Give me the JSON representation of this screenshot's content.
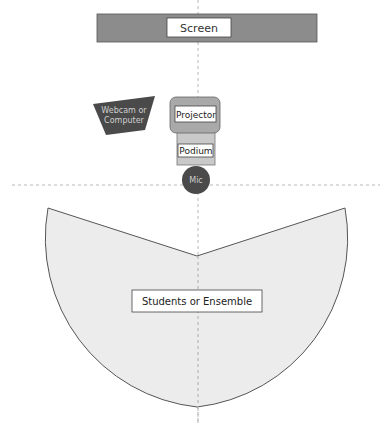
{
  "diagram": {
    "screen": {
      "label": "Screen"
    },
    "webcam": {
      "label_line1": "Webcam or",
      "label_line2": "Computer"
    },
    "projector": {
      "label": "Projector"
    },
    "podium": {
      "label": "Podium"
    },
    "mic": {
      "label": "Mic"
    },
    "audience": {
      "label": "Students or Ensemble"
    }
  },
  "colors": {
    "screen_fill": "#8c8c8c",
    "dark_fill": "#4a4a4a",
    "mic_fill": "#4a4a4a",
    "projector_fill": "#a9a9a9",
    "podium_fill": "#c9c9c9",
    "audience_fill": "#ececec",
    "stroke": "#555555",
    "guide": "#b0b0b0"
  }
}
